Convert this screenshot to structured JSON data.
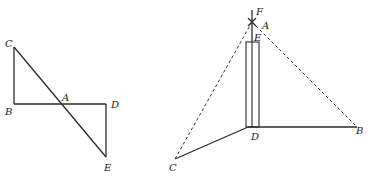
{
  "figures": [
    {
      "id": "figure-left",
      "labels": {
        "C": "C",
        "B": "B",
        "A": "A",
        "D": "D",
        "E": "E"
      },
      "segments": [
        "CB",
        "BD",
        "CE",
        "DE"
      ],
      "intersection": "A"
    },
    {
      "id": "figure-right",
      "labels": {
        "F": "F",
        "A": "A",
        "E": "E",
        "D": "D",
        "B": "B",
        "C": "C"
      },
      "solid_segments": [
        "DB",
        "DC",
        "FE"
      ],
      "dashed_segments": [
        "AC",
        "AB"
      ],
      "rectangle": "pole ED"
    }
  ],
  "colors": {
    "line": "#2a2a2a",
    "background": "#ffffff"
  }
}
